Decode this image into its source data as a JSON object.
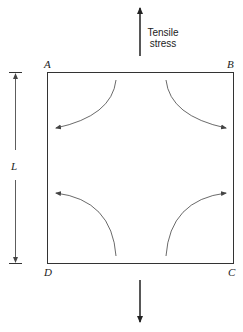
{
  "diagram": {
    "corners": {
      "top_left": "A",
      "top_right": "B",
      "bottom_right": "C",
      "bottom_left": "D"
    },
    "dimension_label": "L",
    "stress_label_line1": "Tensile",
    "stress_label_line2": "stress",
    "line_color": "#222222",
    "curve_color": "#444444"
  }
}
